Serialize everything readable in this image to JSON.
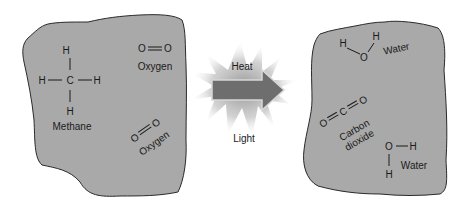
{
  "diagram": {
    "colors": {
      "blob_fill": "#a9a9a9",
      "blob_stroke": "#2a2a2a",
      "arrow_fill": "#6e6e6e",
      "burst": "#9a9a9a",
      "text": "#1a1a1a"
    },
    "reactants": {
      "methane": {
        "atoms": {
          "center": "C",
          "top": "H",
          "bottom": "H",
          "left": "H",
          "right": "H"
        },
        "label": "Methane"
      },
      "oxygen_1": {
        "atoms": [
          "O",
          "O"
        ],
        "label": "Oxygen"
      },
      "oxygen_2": {
        "atoms": [
          "O",
          "O"
        ],
        "label": "Oxygen"
      }
    },
    "reaction": {
      "top_label": "Heat",
      "bottom_label": "Light"
    },
    "products": {
      "water_1": {
        "atoms": {
          "h1": "H",
          "o": "O",
          "h2": "H"
        },
        "label": "Water"
      },
      "carbon_dioxide": {
        "atoms": {
          "o1": "O",
          "c": "C",
          "o2": "O"
        },
        "label_line1": "Carbon",
        "label_line2": "dioxide"
      },
      "water_2": {
        "atoms": {
          "o": "O",
          "h1": "H",
          "h2": "H"
        },
        "label": "Water"
      }
    }
  }
}
